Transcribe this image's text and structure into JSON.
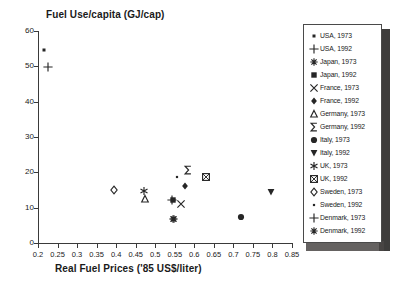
{
  "chart_data": {
    "type": "scatter",
    "title": "Fuel Use/capita (GJ/cap)",
    "xlabel": "Real Fuel Prices ('85 US$/liter)",
    "ylabel": "Fuel Use/capita (GJ/cap)",
    "xlim": [
      0.2,
      0.85
    ],
    "ylim": [
      0,
      60
    ],
    "xticks": [
      "0.2",
      "0.25",
      "0.3",
      "0.35",
      "0.4",
      "0.45",
      "0.5",
      "0.55",
      "0.6",
      "0.65",
      "0.7",
      "0.75",
      "0.8",
      "0.85"
    ],
    "xtick_values": [
      0.2,
      0.25,
      0.3,
      0.35,
      0.4,
      0.45,
      0.5,
      0.55,
      0.6,
      0.65,
      0.7,
      0.75,
      0.8,
      0.85
    ],
    "yticks": [
      "0",
      "10",
      "20",
      "30",
      "40",
      "50",
      "60"
    ],
    "ytick_values": [
      0,
      10,
      20,
      30,
      40,
      50,
      60
    ],
    "grid": false,
    "legend_position": "right-outside",
    "series": [
      {
        "name": "USA, 1973",
        "marker": "small-filled-square",
        "x": [
          0.215
        ],
        "y": [
          54.5
        ]
      },
      {
        "name": "USA, 1992",
        "marker": "plus",
        "x": [
          0.226
        ],
        "y": [
          49.7
        ]
      },
      {
        "name": "Japan, 1973",
        "marker": "asterisk",
        "x": [
          0.545
        ],
        "y": [
          6.7
        ]
      },
      {
        "name": "Japan, 1992",
        "marker": "filled-square",
        "x": [
          0.545
        ],
        "y": [
          12.2
        ]
      },
      {
        "name": "France, 1973",
        "marker": "cross-x",
        "x": [
          0.565
        ],
        "y": [
          10.9
        ]
      },
      {
        "name": "France, 1992",
        "marker": "filled-diamond",
        "x": [
          0.575
        ],
        "y": [
          16.0
        ]
      },
      {
        "name": "Germany, 1973",
        "marker": "open-triangle-up",
        "x": [
          0.474
        ],
        "y": [
          12.4
        ]
      },
      {
        "name": "Germany, 1992",
        "marker": "sigma",
        "x": [
          0.585
        ],
        "y": [
          20.7
        ]
      },
      {
        "name": "Italy, 1973",
        "marker": "filled-circle",
        "x": [
          0.72
        ],
        "y": [
          7.5
        ]
      },
      {
        "name": "Italy, 1992",
        "marker": "filled-triangle-down",
        "x": [
          0.795
        ],
        "y": [
          14.5
        ]
      },
      {
        "name": "UK, 1973",
        "marker": "star",
        "x": [
          0.47
        ],
        "y": [
          14.6
        ]
      },
      {
        "name": "UK, 1992",
        "marker": "boxed-x",
        "x": [
          0.63
        ],
        "y": [
          18.7
        ]
      },
      {
        "name": "Sweden, 1973",
        "marker": "open-diamond",
        "x": [
          0.395
        ],
        "y": [
          15.1
        ]
      },
      {
        "name": "Sweden, 1992",
        "marker": "dot",
        "x": [
          0.555
        ],
        "y": [
          18.8
        ]
      },
      {
        "name": "Denmark, 1973",
        "marker": "plus",
        "x": [
          0.543
        ],
        "y": [
          12.2
        ]
      },
      {
        "name": "Denmark, 1992",
        "marker": "asterisk",
        "x": [
          0.547
        ],
        "y": [
          6.7
        ]
      }
    ]
  },
  "colors": {
    "axis": "#3a3a3a",
    "text": "#1a1a1a",
    "marker": "#262626",
    "legend_border": "#4a4a4a",
    "background": "#ffffff",
    "shadow": "#2e2c2b"
  }
}
